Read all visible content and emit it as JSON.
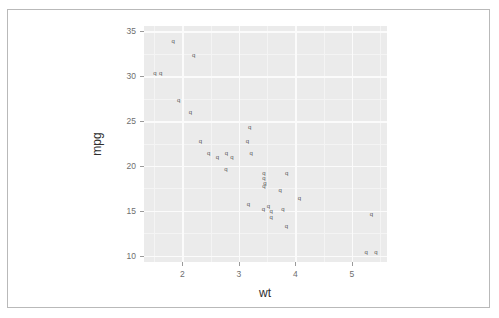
{
  "figure": {
    "background": "#ffffff",
    "frame_color": "#b9b9b9",
    "ghost_text": "mpg vs wt  scatter plot",
    "ghost_text_2": "faded bleed-through line"
  },
  "chart_data": {
    "type": "scatter",
    "title": "",
    "subtitle": "",
    "xlabel": "wt",
    "ylabel": "mpg",
    "xlim": [
      1.32,
      5.62
    ],
    "ylim": [
      9.3,
      35.6
    ],
    "xticks": [
      2,
      3,
      4,
      5
    ],
    "xtick_labels": [
      "2",
      "3",
      "4",
      "5"
    ],
    "yticks": [
      10,
      15,
      20,
      25,
      30,
      35
    ],
    "ytick_labels": [
      "10",
      "15",
      "20",
      "25",
      "30",
      "35"
    ],
    "x_minor_ticks": [
      1.5,
      2.5,
      3.5,
      4.5,
      5.5
    ],
    "y_minor_ticks": [
      12.5,
      17.5,
      22.5,
      27.5,
      32.5
    ],
    "grid": true,
    "grid_color": "#ffffff",
    "panel_background": "#ebebeb",
    "legend": null,
    "legend_position": "none",
    "point_marker": "q",
    "point_color": "#3a3a3a",
    "series": [
      {
        "name": "mtcars",
        "x": [
          2.62,
          2.875,
          2.32,
          3.215,
          3.44,
          3.46,
          3.57,
          3.19,
          3.15,
          3.44,
          3.44,
          4.07,
          3.73,
          3.78,
          5.25,
          5.424,
          5.345,
          2.2,
          1.615,
          1.835,
          2.465,
          3.52,
          3.435,
          3.84,
          3.845,
          1.935,
          2.14,
          1.513,
          3.17,
          2.77,
          3.57,
          2.78
        ],
        "y": [
          21.0,
          21.0,
          22.8,
          21.4,
          18.7,
          18.1,
          14.3,
          24.4,
          22.8,
          19.2,
          17.8,
          16.4,
          17.3,
          15.2,
          10.4,
          10.4,
          14.7,
          32.4,
          30.4,
          33.9,
          21.5,
          15.5,
          15.2,
          13.3,
          19.2,
          27.3,
          26.0,
          30.4,
          15.8,
          19.7,
          15.0,
          21.4
        ]
      }
    ]
  }
}
